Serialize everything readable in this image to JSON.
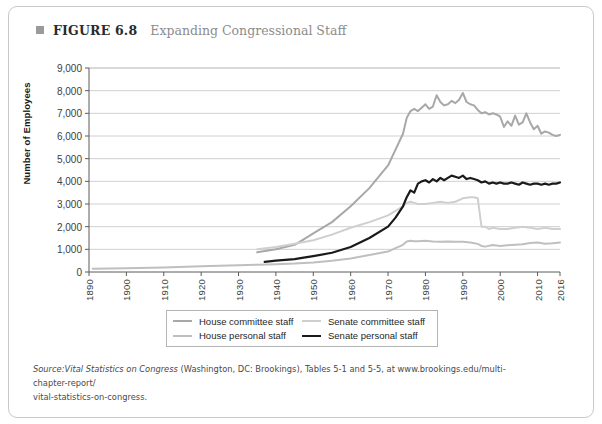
{
  "figure": {
    "number_label": "FIGURE 6.8",
    "title": "Expanding Congressional Staff",
    "bullet_icon": "square-bullet-icon"
  },
  "source_note": {
    "prefix": "Source:",
    "italic_part": "Vital Statistics on Congress",
    "rest_line1": " (Washington, DC: Brookings), Tables 5-1 and 5-5, at www.brookings.edu/multi-chapter-report/",
    "line2": "vital-statistics-on-congress.",
    "full_text": "Source: Vital Statistics on Congress (Washington, DC: Brookings), Tables 5-1 and 5-5, at www.brookings.edu/multi-chapter-report/vital-statistics-on-congress."
  },
  "colors": {
    "house_committee": "#a8a8a8",
    "house_personal": "#bfbfbf",
    "senate_committee": "#cfcfcf",
    "senate_personal": "#1a1a1a",
    "gridline": "#c4c4c4",
    "axis": "#5a5a5a",
    "frame": "#c9c9c9",
    "title_gray": "#8c8c8c"
  },
  "chart_data": {
    "type": "line",
    "title": "Expanding Congressional Staff",
    "xlabel": "",
    "ylabel": "Number of Employees",
    "xlim": [
      1890,
      2016
    ],
    "ylim": [
      0,
      9000
    ],
    "grid": true,
    "legend_position": "bottom-center",
    "yticks": [
      0,
      1000,
      2000,
      3000,
      4000,
      5000,
      6000,
      7000,
      8000,
      9000
    ],
    "ytick_labels": [
      "0",
      "1,000",
      "2,000",
      "3,000",
      "4,000",
      "5,000",
      "6,000",
      "7,000",
      "8,000",
      "9,000"
    ],
    "xticks": [
      1890,
      1900,
      1910,
      1920,
      1930,
      1940,
      1950,
      1960,
      1970,
      1980,
      1990,
      2000,
      2010,
      2016
    ],
    "xtick_labels": [
      "1890",
      "1900",
      "1910",
      "1920",
      "1930",
      "1940",
      "1950",
      "1960",
      "1970",
      "1980",
      "1990",
      "2000",
      "2010",
      "2016"
    ],
    "series": [
      {
        "name": "House committee staff",
        "color": "#a8a8a8",
        "width": 2.0,
        "x": [
          1935,
          1940,
          1945,
          1947,
          1950,
          1955,
          1960,
          1965,
          1970,
          1972,
          1974,
          1975,
          1976,
          1977,
          1978,
          1979,
          1980,
          1981,
          1982,
          1983,
          1984,
          1985,
          1986,
          1987,
          1988,
          1989,
          1990,
          1991,
          1992,
          1993,
          1994,
          1995,
          1996,
          1997,
          1998,
          1999,
          2000,
          2001,
          2002,
          2003,
          2004,
          2005,
          2006,
          2007,
          2008,
          2009,
          2010,
          2011,
          2012,
          2013,
          2014,
          2015,
          2016
        ],
        "y": [
          870,
          1000,
          1200,
          1400,
          1700,
          2200,
          2900,
          3700,
          4700,
          5400,
          6100,
          6800,
          7100,
          7200,
          7100,
          7250,
          7400,
          7200,
          7300,
          7800,
          7500,
          7350,
          7400,
          7550,
          7450,
          7600,
          7900,
          7500,
          7400,
          7350,
          7150,
          7000,
          7050,
          6950,
          7000,
          6950,
          6850,
          6400,
          6650,
          6450,
          6900,
          6500,
          6600,
          7000,
          6600,
          6300,
          6450,
          6100,
          6200,
          6150,
          6050,
          6000,
          6050
        ]
      },
      {
        "name": "House personal staff",
        "color": "#bfbfbf",
        "width": 2.0,
        "x": [
          1891,
          1900,
          1910,
          1920,
          1930,
          1935,
          1940,
          1945,
          1950,
          1955,
          1960,
          1965,
          1970,
          1972,
          1974,
          1975,
          1976,
          1977,
          1978,
          1980,
          1982,
          1984,
          1986,
          1988,
          1990,
          1992,
          1994,
          1995,
          1996,
          1998,
          2000,
          2002,
          2004,
          2006,
          2008,
          2010,
          2012,
          2014,
          2016
        ],
        "y": [
          140,
          170,
          200,
          250,
          300,
          320,
          340,
          370,
          420,
          500,
          600,
          750,
          900,
          1050,
          1200,
          1350,
          1380,
          1360,
          1360,
          1380,
          1350,
          1340,
          1350,
          1340,
          1330,
          1300,
          1240,
          1150,
          1120,
          1190,
          1150,
          1180,
          1200,
          1220,
          1280,
          1300,
          1250,
          1270,
          1300
        ]
      },
      {
        "name": "Senate committee staff",
        "color": "#cfcfcf",
        "width": 2.0,
        "x": [
          1935,
          1940,
          1945,
          1950,
          1955,
          1960,
          1965,
          1970,
          1972,
          1974,
          1975,
          1976,
          1977,
          1978,
          1980,
          1982,
          1984,
          1986,
          1988,
          1990,
          1992,
          1993,
          1994,
          1995,
          1996,
          1997,
          1998,
          2000,
          2002,
          2004,
          2006,
          2008,
          2010,
          2012,
          2014,
          2016
        ],
        "y": [
          1000,
          1100,
          1250,
          1400,
          1650,
          1950,
          2200,
          2500,
          2700,
          2900,
          3050,
          3100,
          3050,
          3000,
          3000,
          3050,
          3100,
          3050,
          3100,
          3250,
          3300,
          3300,
          3250,
          2000,
          2000,
          1900,
          1950,
          1900,
          1900,
          1950,
          2000,
          1950,
          1900,
          1950,
          1900,
          1900
        ]
      },
      {
        "name": "Senate personal staff",
        "color": "#1a1a1a",
        "width": 2.2,
        "x": [
          1937,
          1940,
          1945,
          1947,
          1950,
          1955,
          1960,
          1965,
          1970,
          1972,
          1974,
          1975,
          1976,
          1977,
          1978,
          1979,
          1980,
          1981,
          1982,
          1983,
          1984,
          1985,
          1986,
          1987,
          1988,
          1989,
          1990,
          1991,
          1992,
          1993,
          1994,
          1995,
          1996,
          1997,
          1998,
          1999,
          2000,
          2001,
          2002,
          2003,
          2004,
          2005,
          2006,
          2007,
          2008,
          2009,
          2010,
          2011,
          2012,
          2013,
          2014,
          2015,
          2016
        ],
        "y": [
          450,
          500,
          570,
          620,
          700,
          850,
          1100,
          1500,
          2000,
          2400,
          2900,
          3300,
          3600,
          3500,
          3900,
          4000,
          4050,
          3950,
          4100,
          4000,
          4150,
          4050,
          4150,
          4250,
          4200,
          4150,
          4250,
          4100,
          4150,
          4100,
          4050,
          3950,
          4000,
          3900,
          3950,
          3900,
          3950,
          3900,
          3900,
          3950,
          3900,
          3850,
          3950,
          3900,
          3850,
          3900,
          3900,
          3850,
          3900,
          3850,
          3900,
          3900,
          3950
        ]
      }
    ]
  },
  "legend": {
    "items": [
      {
        "label": "House committee staff",
        "color": "#a8a8a8",
        "icon": "line-swatch-icon"
      },
      {
        "label": "Senate committee staff",
        "color": "#cfcfcf",
        "icon": "line-swatch-icon"
      },
      {
        "label": "House personal staff",
        "color": "#bfbfbf",
        "icon": "line-swatch-icon"
      },
      {
        "label": "Senate personal staff",
        "color": "#1a1a1a",
        "icon": "line-swatch-icon"
      }
    ]
  }
}
